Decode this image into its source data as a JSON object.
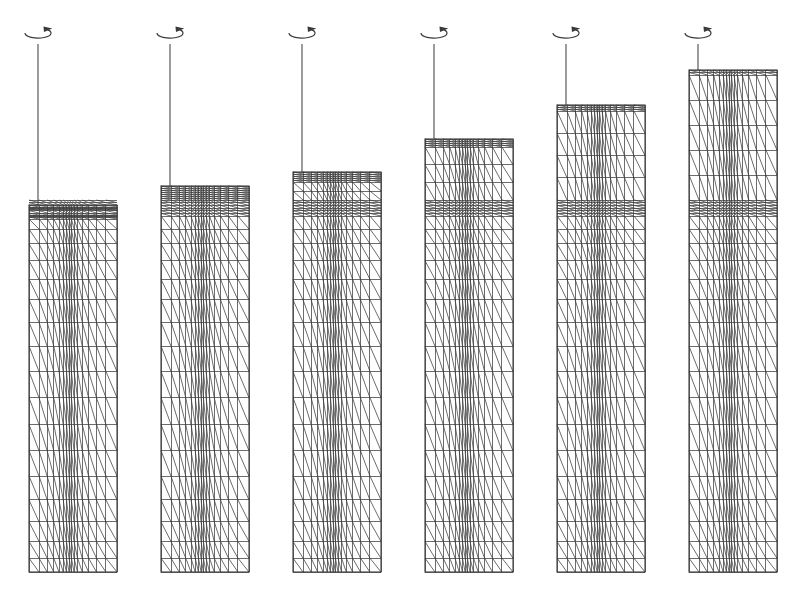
{
  "figure": {
    "panel_count": 6,
    "background_color": "#ffffff",
    "mesh_color": "#3b3b3b",
    "axis_color": "#4a4a4a",
    "canvas": {
      "width": 801,
      "height": 599
    }
  },
  "geometry": {
    "baseline_y": 572,
    "panel_width": 88,
    "panel_pitch": 132,
    "dense_band_top": 200,
    "dense_band_bottom": 216,
    "axis_symbol_y": 33,
    "axis_symbol_rx": 13,
    "axis_symbol_ry": 5,
    "columns": 15,
    "column_weights": [
      1.9,
      1.55,
      1.25,
      1.0,
      0.8,
      0.62,
      0.5,
      0.44,
      0.5,
      0.66,
      0.9,
      1.2,
      1.5,
      1.8,
      2.1
    ],
    "rows_below_band": 17,
    "row_weights_below": [
      0.55,
      0.62,
      0.7,
      0.78,
      0.86,
      0.94,
      1.0,
      1.06,
      1.1,
      1.12,
      1.1,
      1.06,
      1.0,
      0.92,
      0.82,
      0.7,
      0.58
    ]
  },
  "panels": [
    {
      "index": 1,
      "label": "stage-1",
      "axis_x": 38,
      "mesh_left": 29,
      "mesh_right": 117,
      "mesh_top": 205,
      "mesh_bottom": 572,
      "height": 367,
      "rows_above_band": 0,
      "compressed_rows_at_top": 7,
      "axis_top": 38
    },
    {
      "index": 2,
      "label": "stage-2",
      "axis_x": 170,
      "mesh_left": 161,
      "mesh_right": 249,
      "mesh_top": 186,
      "mesh_bottom": 572,
      "height": 386,
      "rows_above_band": 1,
      "compressed_rows_at_top": 6,
      "axis_top": 38
    },
    {
      "index": 3,
      "label": "stage-3",
      "axis_x": 302,
      "mesh_left": 293,
      "mesh_right": 381,
      "mesh_top": 172,
      "mesh_bottom": 572,
      "height": 400,
      "rows_above_band": 2,
      "compressed_rows_at_top": 5,
      "axis_top": 38
    },
    {
      "index": 4,
      "label": "stage-4",
      "axis_x": 434,
      "mesh_left": 425,
      "mesh_right": 513,
      "mesh_top": 139,
      "mesh_bottom": 572,
      "height": 433,
      "rows_above_band": 3,
      "compressed_rows_at_top": 4,
      "axis_top": 38
    },
    {
      "index": 5,
      "label": "stage-5",
      "axis_x": 566,
      "mesh_left": 557,
      "mesh_right": 645,
      "mesh_top": 105,
      "mesh_bottom": 572,
      "height": 467,
      "rows_above_band": 4,
      "compressed_rows_at_top": 3,
      "axis_top": 38
    },
    {
      "index": 6,
      "label": "stage-6",
      "axis_x": 698,
      "mesh_left": 689,
      "mesh_right": 777,
      "mesh_top": 70,
      "mesh_bottom": 572,
      "height": 502,
      "rows_above_band": 5,
      "compressed_rows_at_top": 2,
      "axis_top": 38
    }
  ],
  "axis_symbol": {
    "name": "rotation-axis-symbol",
    "description": "ellipse with arrowhead indicating axis of revolution"
  }
}
